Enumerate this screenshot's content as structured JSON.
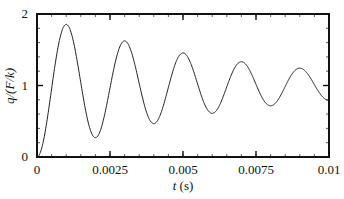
{
  "chart_data": {
    "type": "line",
    "title": "",
    "xlabel": "t (s)",
    "xlabel_var": "t",
    "xlabel_unit": " (s)",
    "ylabel": "q/(F/k)",
    "xlim": [
      0,
      0.01
    ],
    "ylim": [
      0,
      2
    ],
    "grid": false,
    "legend": null,
    "x_ticks": [
      {
        "value": 0,
        "label": "0"
      },
      {
        "value": 0.0025,
        "label": "0.0025"
      },
      {
        "value": 0.005,
        "label": "0.005"
      },
      {
        "value": 0.0075,
        "label": "0.0075"
      },
      {
        "value": 0.01,
        "label": "0.01"
      }
    ],
    "y_ticks": [
      {
        "value": 0,
        "label": "0"
      },
      {
        "value": 1,
        "label": "1"
      },
      {
        "value": 2,
        "label": "2"
      }
    ],
    "x_minor_step": 0.0005,
    "y_minor_step": 0.2,
    "series": [
      {
        "name": "q/(F/k)",
        "color": "#222222",
        "model": {
          "type": "damped_step_response",
          "omega_d": 3141.6,
          "zeta": 0.05
        },
        "x": [
          0,
          0.00096,
          0.002,
          0.003,
          0.004,
          0.005,
          0.006,
          0.007,
          0.008,
          0.009,
          0.01
        ],
        "y": [
          0,
          1.86,
          0.27,
          1.62,
          0.48,
          1.47,
          0.62,
          1.34,
          0.71,
          1.25,
          0.8
        ]
      }
    ]
  }
}
